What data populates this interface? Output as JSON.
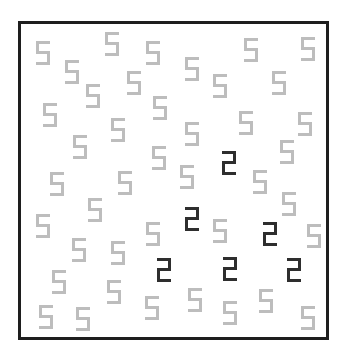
{
  "stimulus": {
    "frame": {
      "left": 18,
      "top": 21,
      "width": 311,
      "height": 319,
      "border_color": "#1e1e1e"
    },
    "colors": {
      "distractor": "#bdbdbd",
      "target": "#2e2e2e",
      "background": "#ffffff"
    },
    "glyph_size": {
      "width": 14,
      "height": 24
    },
    "distractor_symbol": "5",
    "target_symbol": "2",
    "distractor_count": 41,
    "target_count": 6,
    "distractors": [
      {
        "x": 36,
        "y": 41
      },
      {
        "x": 65,
        "y": 60
      },
      {
        "x": 105,
        "y": 32
      },
      {
        "x": 146,
        "y": 41
      },
      {
        "x": 86,
        "y": 84
      },
      {
        "x": 127,
        "y": 71
      },
      {
        "x": 153,
        "y": 96
      },
      {
        "x": 43,
        "y": 103
      },
      {
        "x": 185,
        "y": 57
      },
      {
        "x": 213,
        "y": 74
      },
      {
        "x": 244,
        "y": 38
      },
      {
        "x": 272,
        "y": 71
      },
      {
        "x": 301,
        "y": 37
      },
      {
        "x": 111,
        "y": 118
      },
      {
        "x": 73,
        "y": 135
      },
      {
        "x": 152,
        "y": 146
      },
      {
        "x": 50,
        "y": 172
      },
      {
        "x": 118,
        "y": 171
      },
      {
        "x": 185,
        "y": 122
      },
      {
        "x": 239,
        "y": 111
      },
      {
        "x": 298,
        "y": 112
      },
      {
        "x": 280,
        "y": 140
      },
      {
        "x": 180,
        "y": 165
      },
      {
        "x": 253,
        "y": 170
      },
      {
        "x": 282,
        "y": 192
      },
      {
        "x": 88,
        "y": 198
      },
      {
        "x": 36,
        "y": 214
      },
      {
        "x": 146,
        "y": 222
      },
      {
        "x": 72,
        "y": 238
      },
      {
        "x": 111,
        "y": 241
      },
      {
        "x": 52,
        "y": 270
      },
      {
        "x": 107,
        "y": 280
      },
      {
        "x": 145,
        "y": 296
      },
      {
        "x": 39,
        "y": 305
      },
      {
        "x": 76,
        "y": 307
      },
      {
        "x": 213,
        "y": 219
      },
      {
        "x": 307,
        "y": 224
      },
      {
        "x": 188,
        "y": 288
      },
      {
        "x": 223,
        "y": 301
      },
      {
        "x": 259,
        "y": 289
      },
      {
        "x": 301,
        "y": 306
      }
    ],
    "targets": [
      {
        "x": 222,
        "y": 151
      },
      {
        "x": 185,
        "y": 207
      },
      {
        "x": 263,
        "y": 222
      },
      {
        "x": 157,
        "y": 258
      },
      {
        "x": 223,
        "y": 257
      },
      {
        "x": 287,
        "y": 258
      }
    ]
  }
}
